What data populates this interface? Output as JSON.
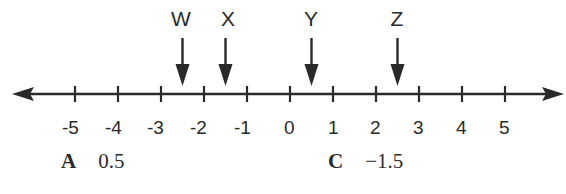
{
  "diagram": {
    "type": "number_line",
    "axis": {
      "min": -5,
      "max": 5,
      "step": 1,
      "arrows_both_ends": true,
      "ticks": [
        "-5",
        "-4",
        "-3",
        "-2",
        "-1",
        "0",
        "1",
        "2",
        "3",
        "4",
        "5"
      ]
    },
    "points": [
      {
        "label": "W",
        "value": -2.5
      },
      {
        "label": "X",
        "value": -1.5
      },
      {
        "label": "Y",
        "value": 0.5
      },
      {
        "label": "Z",
        "value": 2.5
      }
    ],
    "answer_choices": [
      {
        "letter": "A",
        "value": "0.5"
      },
      {
        "letter": "C",
        "value": "−1.5"
      }
    ],
    "colors": {
      "ink": "#2a2a2a",
      "background": "#ffffff"
    }
  }
}
